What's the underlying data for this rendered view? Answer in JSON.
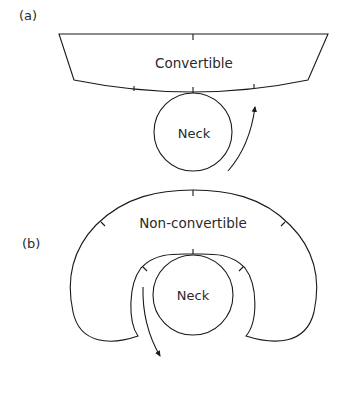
{
  "panels": [
    {
      "id": "a",
      "label": "(a)",
      "region_label": "Convertible",
      "neck_label": "Neck"
    },
    {
      "id": "b",
      "label": "(b)",
      "region_label": "Non-convertible",
      "neck_label": "Neck"
    }
  ],
  "colors": {
    "line": "#1a1a1a",
    "text": "#2a2a2a",
    "background": "#ffffff"
  }
}
